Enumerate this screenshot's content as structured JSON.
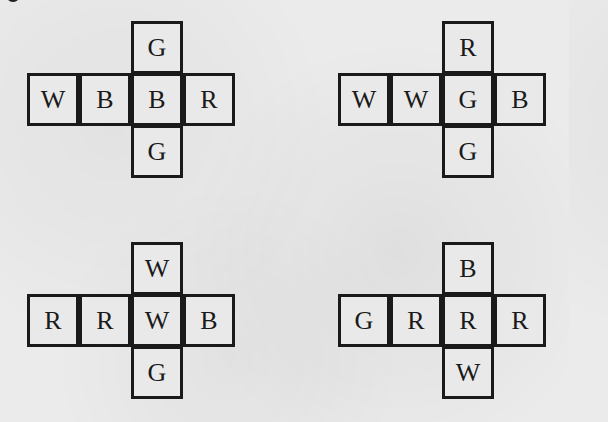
{
  "figure": {
    "nets": [
      {
        "position": "top-left",
        "top": "G",
        "row": [
          "W",
          "B",
          "B",
          "R"
        ],
        "bottom": "G"
      },
      {
        "position": "top-right",
        "top": "R",
        "row": [
          "W",
          "W",
          "G",
          "B"
        ],
        "bottom": "G"
      },
      {
        "position": "bottom-left",
        "top": "W",
        "row": [
          "R",
          "R",
          "W",
          "B"
        ],
        "bottom": "G"
      },
      {
        "position": "bottom-right",
        "top": "B",
        "row": [
          "G",
          "R",
          "R",
          "R"
        ],
        "bottom": "W"
      }
    ]
  }
}
